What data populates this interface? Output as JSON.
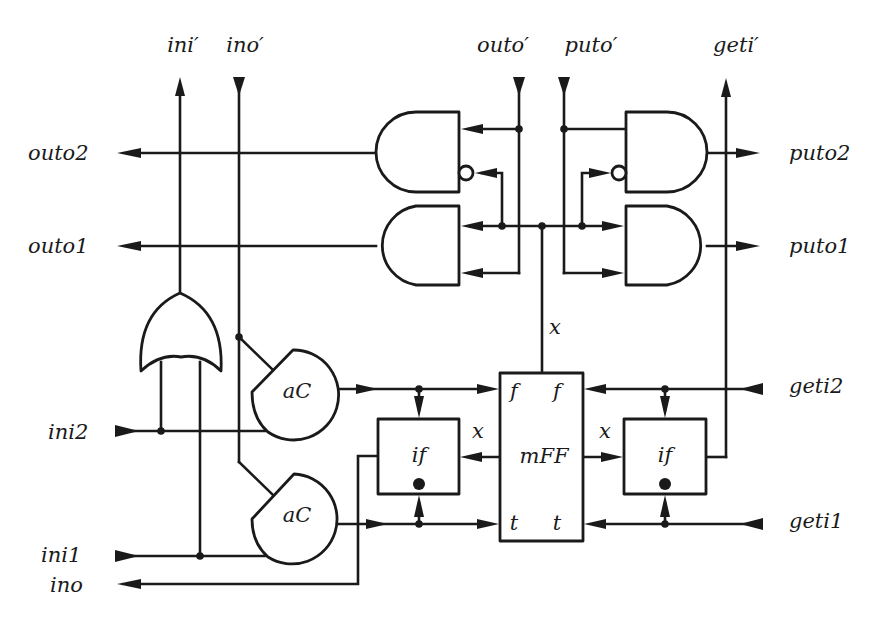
{
  "diagram": {
    "type": "circuit",
    "top_ports": {
      "ini_prime": "ini′",
      "ino_prime": "ino′",
      "outo_prime": "outo′",
      "puto_prime": "puto′",
      "geti_prime": "geti′"
    },
    "left_ports": {
      "outo2": "outo2",
      "outo1": "outo1",
      "ini2": "ini2",
      "ini1": "ini1",
      "ino": "ino"
    },
    "right_ports": {
      "puto2": "puto2",
      "puto1": "puto1",
      "geti2": "geti2",
      "geti1": "geti1"
    },
    "components": {
      "ac_upper": "aC",
      "ac_lower": "aC",
      "if_left": "if",
      "if_right": "if",
      "mff": "mFF",
      "mff_f_left": "f",
      "mff_f_right": "f",
      "mff_t_left": "t",
      "mff_t_right": "t"
    },
    "signals": {
      "x_top": "x",
      "x_left": "x",
      "x_right": "x"
    },
    "gates": [
      "AND outo2",
      "AND outo1 (inverted input on outo2 gate)",
      "AND puto2",
      "AND puto1",
      "OR ini'"
    ]
  }
}
